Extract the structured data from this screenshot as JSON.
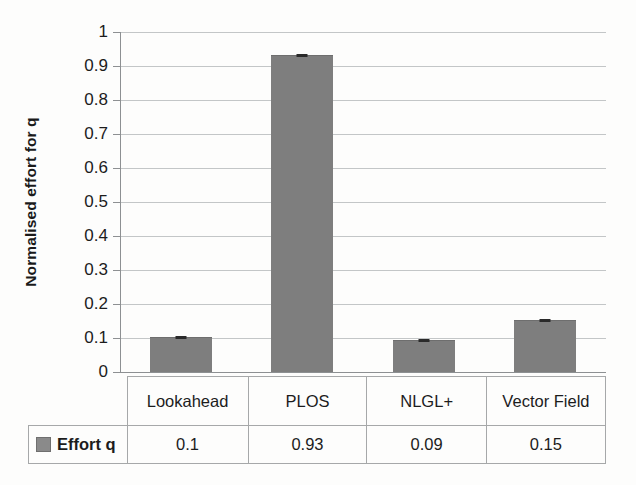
{
  "chart_data": {
    "type": "bar",
    "title": "",
    "xlabel": "",
    "ylabel": "Normalised effort for q",
    "categories": [
      "Lookahead",
      "PLOS",
      "NLGL+",
      "Vector Field"
    ],
    "values": [
      0.1,
      0.93,
      0.09,
      0.15
    ],
    "value_labels": [
      "0.1",
      "0.93",
      "0.09",
      "0.15"
    ],
    "series": [
      {
        "name": "Effort q",
        "values": [
          0.1,
          0.93,
          0.09,
          0.15
        ],
        "color": "#7e7e7e"
      }
    ],
    "ylim": [
      0,
      1
    ],
    "ytick_step": 0.1,
    "ytick_labels": [
      "1",
      "0.9",
      "0.8",
      "0.7",
      "0.6",
      "0.5",
      "0.4",
      "0.3",
      "0.2",
      "0.1",
      "0"
    ],
    "ytick_values": [
      1,
      0.9,
      0.8,
      0.7,
      0.6,
      0.5,
      0.4,
      0.3,
      0.2,
      0.1,
      0
    ],
    "grid": true,
    "grid_axis": "y",
    "legend_position": "data-table-row",
    "has_error_bars": true,
    "data_table": {
      "legend_label": "Effort q",
      "swatch_color": "#8a8a8a",
      "category_row": [
        "Lookahead",
        "PLOS",
        "NLGL+",
        "Vector Field"
      ],
      "value_row": [
        "0.1",
        "0.93",
        "0.09",
        "0.15"
      ]
    },
    "colors": {
      "bar": "#7e7e7e",
      "gridline": "#b9bcbd",
      "axis": "#8d9092",
      "text": "#1c1c1c",
      "background": "#fdfdfc"
    }
  }
}
